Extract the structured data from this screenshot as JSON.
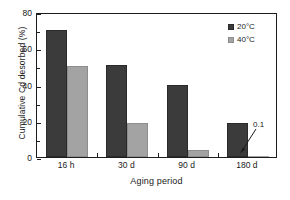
{
  "chart_data": {
    "type": "bar",
    "title": "",
    "subtitle": "",
    "xlabel": "Aging period",
    "ylabel": "Cumulative Cd desorbed (%)",
    "categories": [
      "16 h",
      "30 d",
      "90 d",
      "180 d"
    ],
    "series": [
      {
        "name": "20°C",
        "values": [
          70,
          51,
          40,
          19
        ],
        "color": "#3b3b3b"
      },
      {
        "name": "40°C",
        "values": [
          50,
          18.5,
          4,
          0.1
        ],
        "color": "#a3a3a3"
      }
    ],
    "ylim": [
      0,
      80
    ],
    "yticks": [
      0,
      20,
      40,
      60,
      80
    ],
    "ytick_labels": [
      "0",
      "20",
      "40",
      "60",
      "80"
    ],
    "yminor_ticks": [
      10,
      30,
      50,
      70
    ],
    "grid": false,
    "legend_position": "top-right",
    "annotations": [
      {
        "text": "0.1",
        "points_to_category": "180 d",
        "points_to_series": "40°C",
        "value": 0.1
      }
    ]
  },
  "legend": {
    "entries": [
      {
        "label": "20°C"
      },
      {
        "label": "40°C"
      }
    ]
  },
  "axes": {
    "y_title": "Cumulative Cd desorbed (%)",
    "x_title": "Aging period",
    "y_tick_labels": [
      "80",
      "60",
      "40",
      "20",
      "0"
    ],
    "x_tick_labels": [
      "16 h",
      "30 d",
      "90 d",
      "180 d"
    ]
  },
  "annotation": {
    "label": "0.1"
  }
}
